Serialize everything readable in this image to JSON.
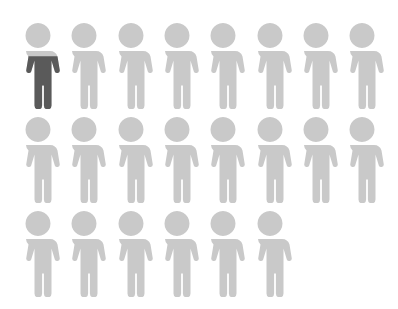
{
  "chart_data": {
    "type": "pictogram",
    "title": "",
    "icon": "person-icon",
    "total_icons": 22,
    "rows": [
      8,
      8,
      6
    ],
    "columns": 8,
    "filled_value": 0.6,
    "filled_icons": [
      {
        "index": 0,
        "fill_fraction": 0.6
      }
    ],
    "values": [
      0.6,
      21.4
    ],
    "categories": [
      "highlighted",
      "remaining"
    ],
    "colors": {
      "filled": "#5a5a5a",
      "empty": "#c9c9c9"
    },
    "legend": "none",
    "grid": false
  },
  "layout": {
    "col_x": [
      16,
      62,
      109,
      155,
      201,
      248,
      294,
      340
    ],
    "row_y": [
      21,
      115,
      209
    ]
  }
}
